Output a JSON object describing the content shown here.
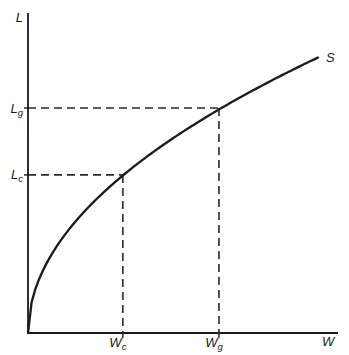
{
  "figure": {
    "background_color": "#ffffff",
    "ink_color": "#1a1a1a"
  },
  "chart_data": {
    "type": "line",
    "title": "",
    "xlabel": "W",
    "ylabel": "L",
    "axis_numeric": false,
    "grid": false,
    "legend": "none",
    "series": [
      {
        "name": "S",
        "shape": "sqrt",
        "description": "Upward-sloping concave labor supply curve, L proportional to sqrt(W), starting vertical at the origin and flattening to the right",
        "x_range_fraction": [
          0,
          0.935
        ],
        "k": 0.89
      }
    ],
    "marked_points": [
      {
        "id": "c",
        "x_label": "Wc",
        "y_label": "Lc",
        "x_fraction": 0.306,
        "y_fraction": 0.494
      },
      {
        "id": "g",
        "x_label": "Wg",
        "y_label": "Lg",
        "x_fraction": 0.616,
        "y_fraction": 0.703
      }
    ]
  },
  "labels": {
    "y_axis": "L",
    "x_axis": "W",
    "curve": "S",
    "lg": {
      "main": "L",
      "sub": "g"
    },
    "lc": {
      "main": "L",
      "sub": "c"
    },
    "wc": {
      "main": "W",
      "sub": "c"
    },
    "wg": {
      "main": "W",
      "sub": "g"
    }
  }
}
